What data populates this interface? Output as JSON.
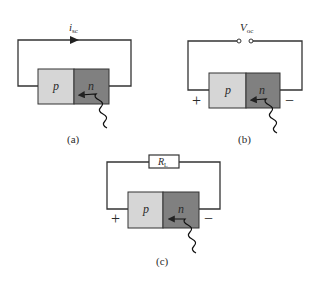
{
  "figure": {
    "colors": {
      "p_region": "#d6d6d6",
      "n_region": "#808080",
      "wire": "#333333",
      "background": "#ffffff"
    },
    "panels": [
      {
        "id": "a",
        "caption": "(a)",
        "p_label": "p",
        "n_label": "n",
        "top_label_main": "i",
        "top_label_sub": "sc",
        "element": "current-arrow"
      },
      {
        "id": "b",
        "caption": "(b)",
        "p_label": "p",
        "n_label": "n",
        "top_label_main": "V",
        "top_label_sub": "oc",
        "element": "open-terminals",
        "plus": "+",
        "minus": "−"
      },
      {
        "id": "c",
        "caption": "(c)",
        "p_label": "p",
        "n_label": "n",
        "top_label_main": "R",
        "top_label_sub": "L",
        "element": "load-resistor",
        "plus": "+",
        "minus": "−"
      }
    ]
  }
}
